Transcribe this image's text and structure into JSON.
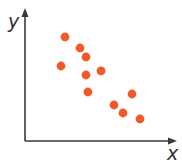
{
  "chart_data": {
    "type": "scatter",
    "title": "",
    "xlabel": "x",
    "ylabel": "y",
    "xlim": [
      0,
      10
    ],
    "ylim": [
      0,
      10
    ],
    "grid": false,
    "legend": null,
    "ticks": false,
    "series": [
      {
        "name": "points",
        "color": "#F05A28",
        "points": [
          {
            "x": 2.76,
            "y": 8.25
          },
          {
            "x": 3.79,
            "y": 7.38
          },
          {
            "x": 4.21,
            "y": 6.67
          },
          {
            "x": 2.48,
            "y": 5.95
          },
          {
            "x": 4.21,
            "y": 5.24
          },
          {
            "x": 5.24,
            "y": 5.56
          },
          {
            "x": 4.34,
            "y": 3.89
          },
          {
            "x": 7.38,
            "y": 3.73
          },
          {
            "x": 6.14,
            "y": 2.86
          },
          {
            "x": 6.76,
            "y": 2.22
          },
          {
            "x": 7.93,
            "y": 1.75
          }
        ]
      }
    ],
    "trend": "negative correlation"
  },
  "colors": {
    "axis": "#3a3a3a",
    "point": "#F05A28"
  }
}
